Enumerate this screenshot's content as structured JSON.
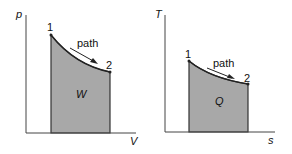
{
  "diagrams": [
    {
      "name": "p-V diagram",
      "y_axis_label": "p",
      "x_axis_label": "V",
      "point_1": "1",
      "point_2": "2",
      "path_label": "path",
      "area_label": "W"
    },
    {
      "name": "T-s diagram",
      "y_axis_label": "T",
      "x_axis_label": "s",
      "point_1": "1",
      "point_2": "2",
      "path_label": "path",
      "area_label": "Q"
    }
  ],
  "colors": {
    "area_fill": "#a8a8a8",
    "line": "#222222"
  }
}
